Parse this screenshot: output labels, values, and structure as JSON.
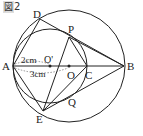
{
  "figure": {
    "label_kanji": "図",
    "label_number": "2"
  },
  "points": {
    "A": "A",
    "B": "B",
    "C": "C",
    "D": "D",
    "E": "E",
    "P": "P",
    "Q": "Q",
    "O": "O",
    "O_prime": "O'"
  },
  "measures": {
    "AO_prime": "2cm",
    "AO": "3cm"
  },
  "colors": {
    "stroke": "#222222",
    "background": "#ffffff"
  }
}
